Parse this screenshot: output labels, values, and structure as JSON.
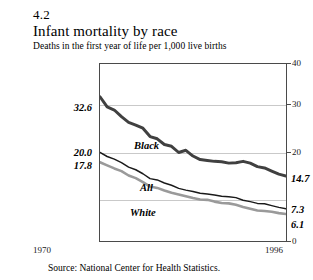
{
  "figure": {
    "number": "4.2",
    "title": "Infant mortality by race",
    "subtitle": "Deaths in the first year of life per 1,000 live births",
    "source": "Source: National Center for Health Statistics."
  },
  "axis": {
    "x_start_label": "1970",
    "x_end_label": "1996",
    "y_ticks": [
      "40",
      "30",
      "20",
      "0"
    ]
  },
  "endpoint_labels": {
    "left_black": "32.6",
    "left_all": "20.0",
    "left_white": "17.8",
    "right_black": "14.7",
    "right_all": "7.3",
    "right_white": "6.1"
  },
  "series_labels": {
    "black": "Black",
    "all": "All",
    "white": "White"
  },
  "colors": {
    "black_line": "#404040",
    "all_line": "#1a1a1a",
    "white_line": "#9a9a9a",
    "grid": "#c9c9c9",
    "frame": "#4a4a4a"
  },
  "chart_data": {
    "type": "line",
    "title": "Infant mortality by race",
    "subtitle": "Deaths in the first year of life per 1,000 live births",
    "xlabel": "",
    "ylabel": "Deaths per 1,000 live births",
    "xlim": [
      1970,
      1996
    ],
    "ylim": [
      0,
      40
    ],
    "yticks": [
      0,
      10,
      20,
      30,
      40
    ],
    "ytick_labels_shown": [
      "40",
      "30",
      "20",
      "0"
    ],
    "grid": "horizontal",
    "legend": "inline-labels",
    "x": [
      1970,
      1971,
      1972,
      1973,
      1974,
      1975,
      1976,
      1977,
      1978,
      1979,
      1980,
      1981,
      1982,
      1983,
      1984,
      1985,
      1986,
      1987,
      1988,
      1989,
      1990,
      1991,
      1992,
      1993,
      1994,
      1995,
      1996
    ],
    "series": [
      {
        "name": "Black",
        "color": "#404040",
        "start_value": 32.6,
        "end_value": 14.7,
        "values": [
          32.6,
          30.3,
          29.6,
          28.1,
          26.8,
          26.2,
          25.5,
          23.6,
          23.1,
          21.8,
          21.4,
          20.0,
          20.5,
          19.2,
          18.4,
          18.2,
          18.0,
          17.9,
          17.6,
          17.7,
          18.0,
          17.6,
          16.8,
          16.5,
          15.8,
          15.1,
          14.7
        ]
      },
      {
        "name": "All",
        "color": "#1a1a1a",
        "start_value": 20.0,
        "end_value": 7.3,
        "values": [
          20.0,
          19.1,
          18.5,
          17.7,
          16.7,
          16.1,
          15.2,
          14.1,
          13.8,
          13.1,
          12.6,
          11.9,
          11.5,
          11.2,
          10.8,
          10.6,
          10.4,
          10.1,
          10.0,
          9.8,
          9.2,
          8.9,
          8.5,
          8.4,
          8.0,
          7.6,
          7.3
        ]
      },
      {
        "name": "White",
        "color": "#9a9a9a",
        "start_value": 17.8,
        "end_value": 6.1,
        "values": [
          17.8,
          17.1,
          16.4,
          15.8,
          14.8,
          14.2,
          13.3,
          12.3,
          12.0,
          11.4,
          10.9,
          10.5,
          10.1,
          9.7,
          9.4,
          9.3,
          8.9,
          8.6,
          8.5,
          8.2,
          7.7,
          7.3,
          6.9,
          6.8,
          6.6,
          6.3,
          6.1
        ]
      }
    ],
    "annotations": [
      {
        "text": "32.6",
        "series": "Black",
        "position": "left-end"
      },
      {
        "text": "20.0",
        "series": "All",
        "position": "left-end"
      },
      {
        "text": "17.8",
        "series": "White",
        "position": "left-end"
      },
      {
        "text": "14.7",
        "series": "Black",
        "position": "right-end"
      },
      {
        "text": "7.3",
        "series": "All",
        "position": "right-end"
      },
      {
        "text": "6.1",
        "series": "White",
        "position": "right-end"
      }
    ]
  }
}
